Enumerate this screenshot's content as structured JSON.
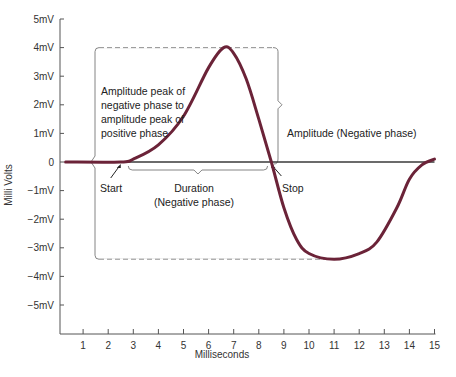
{
  "chart_data": {
    "type": "line",
    "title": "",
    "xlabel": "Milliseconds",
    "ylabel": "Milli Volts",
    "xlim": [
      0,
      15
    ],
    "ylim": [
      -6,
      5
    ],
    "x_ticks": [
      "1",
      "2",
      "3",
      "4",
      "5",
      "6",
      "7",
      "8",
      "9",
      "10",
      "11",
      "12",
      "13",
      "14",
      "15"
    ],
    "y_ticks": [
      "5mV",
      "4mV",
      "3mV",
      "2mV",
      "1mV",
      "0",
      "−1mV",
      "−2mV",
      "−3mV",
      "−4mV",
      "−5mV"
    ],
    "grid": false,
    "series": [
      {
        "name": "Waveform",
        "color": "#6b2338",
        "x": [
          0.3,
          2.5,
          3.0,
          4.0,
          5.0,
          6.0,
          6.6,
          7.0,
          7.5,
          8.0,
          8.5,
          9.0,
          9.5,
          10.0,
          11.0,
          12.0,
          12.7,
          13.5,
          14.0,
          14.5,
          15.0
        ],
        "y": [
          0,
          0,
          0.1,
          0.6,
          1.6,
          3.3,
          4.0,
          3.8,
          2.9,
          1.5,
          0.0,
          -1.6,
          -2.7,
          -3.2,
          -3.4,
          -3.2,
          -2.8,
          -1.6,
          -0.6,
          -0.1,
          0.1
        ]
      }
    ],
    "baseline_y": 0,
    "annotations": [
      {
        "text": "Amplitude peak of negative phase to amplitude peak of positive phase",
        "type": "bracket",
        "x_left": 1.6,
        "y_top": 4.0,
        "y_bottom": -3.4
      },
      {
        "text": "Amplitude (Negative phase)",
        "type": "bracket",
        "y_top": 4.0,
        "y_bottom": 0
      },
      {
        "text": "Start",
        "type": "arrow",
        "x": 2.5,
        "y": 0
      },
      {
        "text": "Stop",
        "type": "arrow",
        "x": 8.5,
        "y": 0
      },
      {
        "text": "Duration (Negative phase)",
        "type": "bracket",
        "x_start": 2.7,
        "x_end": 8.4
      }
    ]
  },
  "labels": {
    "xlabel": "Milliseconds",
    "ylabel": "Milli Volts",
    "amp_peak_lines": [
      "Amplitude peak of",
      "negative phase to",
      "amplitude peak of",
      "positive phase"
    ],
    "amp_negative": "Amplitude (Negative phase)",
    "start": "Start",
    "stop": "Stop",
    "duration_lines": [
      "Duration",
      "(Negative phase)"
    ]
  }
}
